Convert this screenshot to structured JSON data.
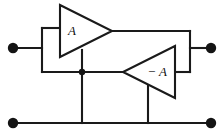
{
  "diagram": {
    "type": "electronic-circuit-schematic",
    "canvas": {
      "width": 224,
      "height": 135
    },
    "colors": {
      "wire": "#1a1a1a",
      "background": "#ffffff",
      "terminal": "#141414",
      "label": "#111111"
    },
    "amplifiers": [
      {
        "id": "amp-a",
        "label": "A",
        "gain_sign": "positive",
        "orientation": "points-right",
        "label_x": 72,
        "label_y": 31,
        "outline": "60,5 60,57 112,31",
        "input_edge_x": 60,
        "output_apex_x": 112,
        "output_apex_y": 31
      },
      {
        "id": "amp-minus-a",
        "label": "− A",
        "gain_sign": "negative",
        "orientation": "points-left",
        "label_x": 157,
        "label_y": 72,
        "outline": "175,46 175,98 123,72",
        "input_edge_x": 175,
        "output_apex_x": 123,
        "output_apex_y": 72
      }
    ],
    "terminals": [
      {
        "id": "input-terminal-left",
        "label": "",
        "x": 13,
        "y": 48,
        "r": 5
      },
      {
        "id": "output-terminal-right",
        "label": "",
        "x": 211,
        "y": 48,
        "r": 5
      },
      {
        "id": "ground-terminal-left",
        "label": "",
        "x": 13,
        "y": 123,
        "r": 5
      },
      {
        "id": "ground-terminal-right",
        "label": "",
        "x": 211,
        "y": 123,
        "r": 5
      }
    ],
    "junctions": [
      {
        "id": "node-mid-left",
        "x": 82,
        "y": 72,
        "r": 3
      }
    ],
    "wires": [
      {
        "id": "wire-left-terminal-stub",
        "d": "M 13 48 L 42 48"
      },
      {
        "id": "wire-left-bus-vertical",
        "d": "M 42 28 L 42 72"
      },
      {
        "id": "wire-left-bus-top",
        "d": "M 42 28 L 61 28"
      },
      {
        "id": "wire-left-bus-bottom",
        "d": "M 42 72 L 82 72"
      },
      {
        "id": "wire-amp-a-output-top",
        "d": "M 111 31 L 190 31"
      },
      {
        "id": "wire-right-bus-vertical",
        "d": "M 190 31 L 190 72"
      },
      {
        "id": "wire-right-terminal-stub",
        "d": "M 190 48 L 211 48"
      },
      {
        "id": "wire-right-bus-to-minus-a",
        "d": "M 174 72 L 190 72"
      },
      {
        "id": "wire-mid-to-minus-a-apex",
        "d": "M 82 72 L 124 72"
      },
      {
        "id": "wire-amp-a-feedback-drop",
        "d": "M 82 50 L 82 123"
      },
      {
        "id": "wire-minus-a-feedback-drop",
        "d": "M 148 85 L 148 123"
      },
      {
        "id": "wire-bottom-rail",
        "d": "M 13 123 L 211 123"
      }
    ]
  }
}
